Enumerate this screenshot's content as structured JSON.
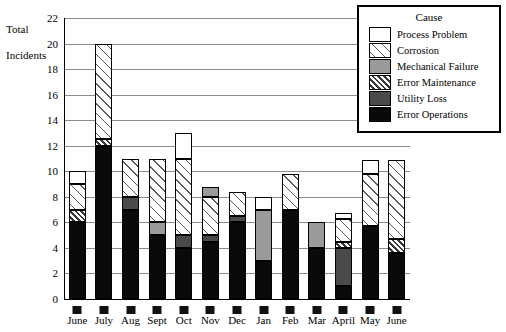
{
  "chart_data": {
    "type": "bar",
    "subtype": "stacked-vertical",
    "title": "",
    "ylabel": "Total Incidents",
    "xlabel": "",
    "ylim": [
      0,
      22
    ],
    "ytick_step": 2,
    "yticks": [
      0,
      2,
      4,
      6,
      8,
      10,
      12,
      14,
      16,
      18,
      20,
      22
    ],
    "grid": true,
    "legend_title": "Cause",
    "legend_position": "top-right",
    "categories": [
      "June",
      "July",
      "Aug",
      "Sept",
      "Oct",
      "Nov",
      "Dec",
      "Jan",
      "Feb",
      "Mar",
      "April",
      "May",
      "June"
    ],
    "series": [
      {
        "name": "Error Operations",
        "pattern": "solid-black",
        "values": [
          6,
          12,
          7,
          5,
          4,
          4.5,
          6,
          3,
          7,
          4,
          1,
          5.7,
          3.6
        ]
      },
      {
        "name": "Utility Loss",
        "pattern": "solid-dark-gray",
        "values": [
          0,
          0,
          1,
          0,
          1,
          0.5,
          0.5,
          0,
          0,
          0,
          3,
          0,
          0
        ]
      },
      {
        "name": "Error Maintenance",
        "pattern": "bold-diagonal-hatch",
        "values": [
          1,
          0.5,
          0,
          0,
          0,
          0,
          0,
          0,
          0,
          0,
          0.5,
          0,
          1.1
        ]
      },
      {
        "name": "Mechanical Failure",
        "pattern": "solid-mid-gray",
        "values": [
          0,
          0,
          0,
          1,
          0,
          0.8,
          0,
          4,
          0,
          2,
          0,
          0,
          0
        ]
      },
      {
        "name": "Corrosion",
        "pattern": "light-diagonal-hatch",
        "values": [
          2,
          7.5,
          3,
          5,
          6,
          3,
          1.9,
          0,
          2.8,
          0,
          1.8,
          4.1,
          6.2
        ]
      },
      {
        "name": "Process Problem",
        "pattern": "white",
        "values": [
          1,
          0,
          0,
          0,
          2,
          0,
          0,
          1,
          0,
          0,
          0.4,
          1.1,
          0
        ]
      }
    ],
    "totals": [
      10,
      20,
      11,
      11,
      13,
      8.8,
      8.4,
      8,
      9.8,
      6,
      6.7,
      10.9,
      10.9
    ],
    "stacks": [
      {
        "category": "June",
        "segments": [
          {
            "series": "Error Operations",
            "from": 0,
            "to": 6
          },
          {
            "series": "Error Maintenance",
            "from": 6,
            "to": 7
          },
          {
            "series": "Corrosion",
            "from": 7,
            "to": 9
          },
          {
            "series": "Process Problem",
            "from": 9,
            "to": 10
          }
        ]
      },
      {
        "category": "July",
        "segments": [
          {
            "series": "Error Operations",
            "from": 0,
            "to": 12
          },
          {
            "series": "Error Maintenance",
            "from": 12,
            "to": 12.5
          },
          {
            "series": "Corrosion",
            "from": 12.5,
            "to": 20
          }
        ]
      },
      {
        "category": "Aug",
        "segments": [
          {
            "series": "Error Operations",
            "from": 0,
            "to": 7
          },
          {
            "series": "Utility Loss",
            "from": 7,
            "to": 8
          },
          {
            "series": "Corrosion",
            "from": 8,
            "to": 11
          }
        ]
      },
      {
        "category": "Sept",
        "segments": [
          {
            "series": "Error Operations",
            "from": 0,
            "to": 5
          },
          {
            "series": "Mechanical Failure",
            "from": 5,
            "to": 6
          },
          {
            "series": "Corrosion",
            "from": 6,
            "to": 11
          }
        ]
      },
      {
        "category": "Oct",
        "segments": [
          {
            "series": "Error Operations",
            "from": 0,
            "to": 4
          },
          {
            "series": "Utility Loss",
            "from": 4,
            "to": 5
          },
          {
            "series": "Corrosion",
            "from": 5,
            "to": 11
          },
          {
            "series": "Process Problem",
            "from": 11,
            "to": 13
          }
        ]
      },
      {
        "category": "Nov",
        "segments": [
          {
            "series": "Error Operations",
            "from": 0,
            "to": 4.5
          },
          {
            "series": "Utility Loss",
            "from": 4.5,
            "to": 5
          },
          {
            "series": "Corrosion",
            "from": 5,
            "to": 8
          },
          {
            "series": "Mechanical Failure",
            "from": 8,
            "to": 8.8
          }
        ]
      },
      {
        "category": "Dec",
        "segments": [
          {
            "series": "Error Operations",
            "from": 0,
            "to": 6
          },
          {
            "series": "Utility Loss",
            "from": 6,
            "to": 6.5
          },
          {
            "series": "Corrosion",
            "from": 6.5,
            "to": 8.4
          }
        ]
      },
      {
        "category": "Jan",
        "segments": [
          {
            "series": "Error Operations",
            "from": 0,
            "to": 3
          },
          {
            "series": "Mechanical Failure",
            "from": 3,
            "to": 7
          },
          {
            "series": "Process Problem",
            "from": 7,
            "to": 8
          }
        ]
      },
      {
        "category": "Feb",
        "segments": [
          {
            "series": "Error Operations",
            "from": 0,
            "to": 7
          },
          {
            "series": "Corrosion",
            "from": 7,
            "to": 9.8
          }
        ]
      },
      {
        "category": "Mar",
        "segments": [
          {
            "series": "Error Operations",
            "from": 0,
            "to": 4
          },
          {
            "series": "Mechanical Failure",
            "from": 4,
            "to": 6
          }
        ]
      },
      {
        "category": "April",
        "segments": [
          {
            "series": "Error Operations",
            "from": 0,
            "to": 1
          },
          {
            "series": "Utility Loss",
            "from": 1,
            "to": 4
          },
          {
            "series": "Error Maintenance",
            "from": 4,
            "to": 4.5
          },
          {
            "series": "Corrosion",
            "from": 4.5,
            "to": 6.3
          },
          {
            "series": "Process Problem",
            "from": 6.3,
            "to": 6.7
          }
        ]
      },
      {
        "category": "May",
        "segments": [
          {
            "series": "Error Operations",
            "from": 0,
            "to": 5.7
          },
          {
            "series": "Corrosion",
            "from": 5.7,
            "to": 9.8
          },
          {
            "series": "Process Problem",
            "from": 9.8,
            "to": 10.9
          }
        ]
      },
      {
        "category": "June",
        "segments": [
          {
            "series": "Error Operations",
            "from": 0,
            "to": 3.6
          },
          {
            "series": "Error Maintenance",
            "from": 3.6,
            "to": 4.7
          },
          {
            "series": "Corrosion",
            "from": 4.7,
            "to": 10.9
          }
        ]
      }
    ]
  },
  "legend": {
    "title": "Cause",
    "items": [
      {
        "label": "Process Problem",
        "fill": "f-process"
      },
      {
        "label": "Corrosion",
        "fill": "f-corrosion"
      },
      {
        "label": "Mechanical Failure",
        "fill": "f-mech"
      },
      {
        "label": "Error Maintenance",
        "fill": "f-errmaint"
      },
      {
        "label": "Utility Loss",
        "fill": "f-utility"
      },
      {
        "label": "Error Operations",
        "fill": "f-errops"
      }
    ]
  },
  "axis": {
    "y_title_line1": "Total",
    "y_title_line2": "Incidents"
  }
}
